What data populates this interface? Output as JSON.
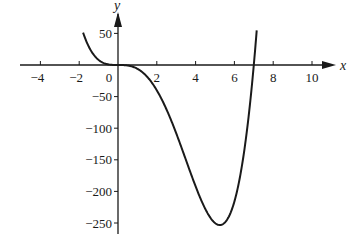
{
  "chart_data": {
    "type": "line",
    "title": "",
    "xlabel": "x",
    "ylabel": "y",
    "xlim": [
      -5,
      11
    ],
    "ylim": [
      -270,
      80
    ],
    "grid": false,
    "legend": null,
    "x_ticks": [
      -4,
      -2,
      0,
      2,
      4,
      6,
      8,
      10
    ],
    "x_tick_labels": [
      "−4",
      "−2",
      "0",
      "2",
      "4",
      "6",
      "8",
      "10"
    ],
    "y_ticks": [
      50,
      -50,
      -100,
      -150,
      -200,
      -250
    ],
    "y_tick_labels": [
      "50",
      "−50",
      "−100",
      "−150",
      "−200",
      "−250"
    ],
    "series": [
      {
        "name": "y = x^4 − 7x^3",
        "x": [
          -1.8,
          -1.5,
          -1.0,
          -0.5,
          0,
          0.5,
          1.0,
          1.5,
          2.0,
          2.5,
          3.0,
          3.5,
          4.0,
          4.5,
          5.0,
          5.25,
          5.5,
          6.0,
          6.5,
          7.0,
          7.15
        ],
        "y": [
          51.3,
          28.7,
          8.0,
          0.9,
          0,
          -0.8,
          -6.0,
          -18.6,
          -40.0,
          -70.3,
          -108.0,
          -150.1,
          -192.0,
          -227.8,
          -250.0,
          -253.2,
          -249.6,
          -216.0,
          -137.3,
          0,
          54.8
        ]
      }
    ],
    "annotations": {
      "x_intercepts": [
        0,
        7
      ],
      "minimum": {
        "x": 5.25,
        "y": -253.2
      },
      "inflection_at_origin": true
    }
  }
}
